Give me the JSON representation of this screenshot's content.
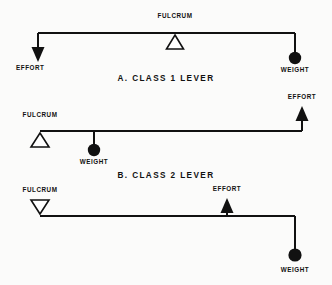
{
  "figure": {
    "background_color": "#fbfbfa",
    "ink_color": "#111111",
    "width": 332,
    "height": 285
  },
  "levers": [
    {
      "id": "class-1",
      "caption": "A. CLASS 1 LEVER",
      "caption_x": 166,
      "caption_y": 80,
      "beam": {
        "x1": 38,
        "x2": 295,
        "y": 33
      },
      "fulcrum": {
        "label": "FULCRUM",
        "label_x": 175,
        "label_y": 18,
        "x": 175,
        "y": 33,
        "orientation": "up",
        "position": "below-beam"
      },
      "effort": {
        "label": "EFFORT",
        "label_x": 16,
        "label_y": 70,
        "arrow_x": 38,
        "arrow_from_y": 33,
        "arrow_to_y": 62,
        "direction": "down"
      },
      "weight": {
        "label": "WEIGHT",
        "label_x": 273,
        "label_y": 72,
        "x": 295,
        "stem_from_y": 33,
        "stem_to_y": 55,
        "ball_cy": 58,
        "ball_r": 6.2
      }
    },
    {
      "id": "class-2",
      "caption": "B. CLASS 2 LEVER",
      "caption_x": 166,
      "caption_y": 177,
      "beam": {
        "x1": 40,
        "x2": 302,
        "y": 131
      },
      "fulcrum": {
        "label": "FULCRUM",
        "label_x": 19,
        "label_y": 116,
        "x": 40,
        "y": 131,
        "orientation": "up",
        "position": "below-beam"
      },
      "effort": {
        "label": "EFFORT",
        "label_x": 280,
        "label_y": 104,
        "arrow_x": 302,
        "arrow_from_y": 131,
        "arrow_to_y": 109,
        "direction": "up"
      },
      "weight": {
        "label": "WEIGHT",
        "label_x": 73,
        "label_y": 164,
        "x": 94,
        "stem_from_y": 131,
        "stem_to_y": 147,
        "ball_cy": 150,
        "ball_r": 6.2
      }
    },
    {
      "id": "class-3",
      "caption": "",
      "caption_x": 0,
      "caption_y": 0,
      "beam": {
        "x1": 40,
        "x2": 295,
        "y": 216
      },
      "fulcrum": {
        "label": "FULCRUM",
        "label_x": 19,
        "label_y": 200,
        "x": 40,
        "y": 216,
        "orientation": "down",
        "position": "above-beam"
      },
      "effort": {
        "label": "EFFORT",
        "label_x": 205,
        "label_y": 195,
        "arrow_x": 227,
        "arrow_from_y": 216,
        "arrow_to_y": 202,
        "direction": "up"
      },
      "weight": {
        "label": "WEIGHT",
        "label_x": 273,
        "label_y": 272,
        "x": 295,
        "stem_from_y": 216,
        "stem_to_y": 252,
        "ball_cy": 255,
        "ball_r": 6.6
      }
    }
  ]
}
